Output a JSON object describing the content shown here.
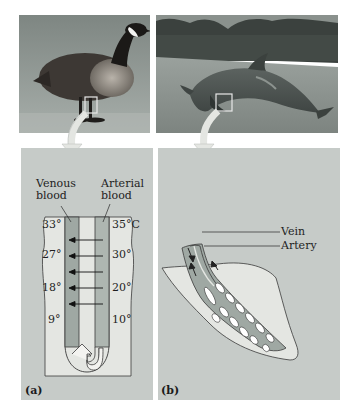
{
  "figure": {
    "panel_a": {
      "letter": "(a)",
      "photo_subject": "Canada goose standing on ice",
      "labels": {
        "venous": [
          "Venous",
          "blood"
        ],
        "arterial": [
          "Arterial",
          "blood"
        ]
      },
      "venous_temps": [
        "33°",
        "27°",
        "18°",
        "9°"
      ],
      "arterial_temps": [
        "35°C",
        "30°",
        "20°",
        "10°"
      ],
      "heat_exchange_arrows": 5
    },
    "panel_b": {
      "letter": "(b)",
      "photo_subject": "Dolphin leaping out of water",
      "labels": {
        "vein": "Vein",
        "artery": "Artery"
      }
    },
    "colors": {
      "panel_bg": "#c6cbc8",
      "tissue_light": "#e4e6e2",
      "vein_fill": "#9fa8a3",
      "artery_fill": "#aeb6b1",
      "outline": "#3a3a3a"
    }
  }
}
